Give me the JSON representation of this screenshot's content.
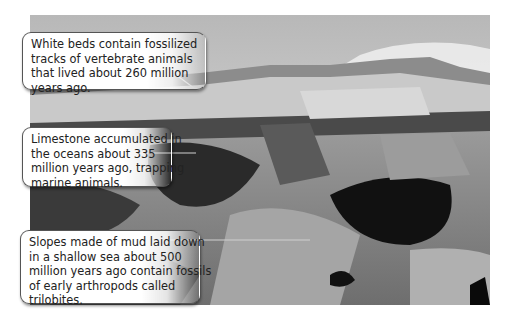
{
  "figure": {
    "callouts": [
      {
        "id": "white-beds",
        "lines": [
          "White beds contain fossilized",
          "tracks of vertebrate animals",
          "that lived about 260 million",
          "years ago."
        ]
      },
      {
        "id": "limestone",
        "lines": [
          "Limestone accumulated in",
          "the oceans about 335",
          "million years ago, trapping",
          "marine animals."
        ]
      },
      {
        "id": "mud-slopes",
        "lines": [
          "Slopes made of mud laid down",
          "in a shallow sea about 500",
          "million years ago contain fossils",
          "of early arthropods called",
          "trilobites."
        ]
      }
    ],
    "colors": {
      "callout_border": "#555555",
      "callout_text": "#222222",
      "leader_line": "#cccccc"
    }
  }
}
